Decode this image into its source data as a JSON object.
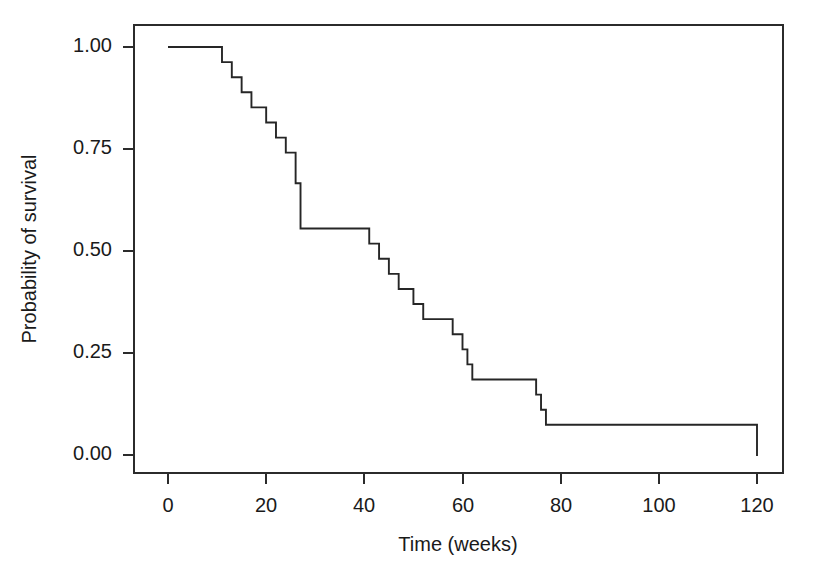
{
  "chart_data": {
    "type": "line",
    "subtype": "kaplan-meier-step",
    "title": "",
    "subtitle": "",
    "xlabel": "Time (weeks)",
    "ylabel": "Probability of survival",
    "xlim": [
      -4,
      128
    ],
    "ylim": [
      -0.04,
      1.06
    ],
    "xticks": [
      0,
      20,
      40,
      60,
      80,
      100,
      120
    ],
    "xtick_labels": [
      "0",
      "20",
      "40",
      "60",
      "80",
      "100",
      "120"
    ],
    "yticks": [
      0.0,
      0.25,
      0.5,
      0.75,
      1.0
    ],
    "ytick_labels": [
      "0.00",
      "0.25",
      "0.50",
      "0.75",
      "1.00"
    ],
    "grid": false,
    "legend": false,
    "legend_position": "none",
    "line_color": "#262626",
    "axis_color": "#2b2b2b",
    "background_color": "#ffffff",
    "series": [
      {
        "name": "Survival",
        "step_type": "post",
        "x": [
          0,
          9,
          11,
          13,
          15,
          17,
          20,
          22,
          24,
          26,
          27,
          39,
          41,
          43,
          45,
          47,
          50,
          52,
          55,
          58,
          60,
          61,
          62,
          73,
          75,
          76,
          77,
          103,
          120
        ],
        "y": [
          1.0,
          1.0,
          0.963,
          0.926,
          0.889,
          0.852,
          0.815,
          0.778,
          0.741,
          0.666,
          0.555,
          0.555,
          0.518,
          0.481,
          0.444,
          0.407,
          0.37,
          0.333,
          0.333,
          0.296,
          0.259,
          0.222,
          0.185,
          0.185,
          0.148,
          0.111,
          0.074,
          0.074,
          0.037
        ]
      }
    ],
    "event_times": [
      9,
      11,
      13,
      15,
      17,
      20,
      22,
      24,
      26,
      39,
      41,
      43,
      45,
      47,
      50,
      52,
      58,
      60,
      61,
      62,
      73,
      75,
      76,
      103
    ],
    "survival_after_event": [
      1.0,
      0.963,
      0.926,
      0.889,
      0.852,
      0.815,
      0.778,
      0.741,
      0.555,
      0.518,
      0.481,
      0.444,
      0.407,
      0.37,
      0.333,
      0.296,
      0.296,
      0.259,
      0.222,
      0.185,
      0.148,
      0.111,
      0.074,
      0.037
    ],
    "final_time": 120,
    "final_survival": 0.037
  },
  "axes": {
    "x_title": "Time (weeks)",
    "y_title": "Probability of survival",
    "x_ticks": [
      {
        "value": 0,
        "label": "0"
      },
      {
        "value": 20,
        "label": "20"
      },
      {
        "value": 40,
        "label": "40"
      },
      {
        "value": 60,
        "label": "60"
      },
      {
        "value": 80,
        "label": "80"
      },
      {
        "value": 100,
        "label": "100"
      },
      {
        "value": 120,
        "label": "120"
      }
    ],
    "y_ticks": [
      {
        "value": 1.0,
        "label": "1.00"
      },
      {
        "value": 0.75,
        "label": "0.75"
      },
      {
        "value": 0.5,
        "label": "0.50"
      },
      {
        "value": 0.25,
        "label": "0.25"
      },
      {
        "value": 0.0,
        "label": "0.00"
      }
    ]
  },
  "colors": {
    "curve": "#262626",
    "axis": "#2b2b2b",
    "text": "#1a1a1a",
    "background": "#ffffff"
  }
}
